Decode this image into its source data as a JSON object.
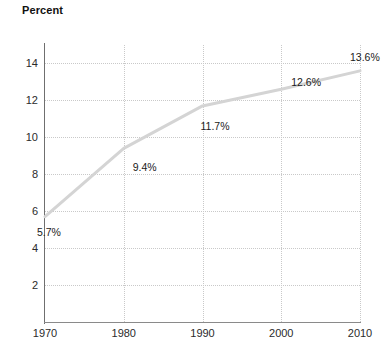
{
  "chart_data": {
    "type": "line",
    "title": "Percent",
    "xlabel": "",
    "ylabel": "Percent",
    "x": [
      1970,
      1980,
      1990,
      2000,
      2010
    ],
    "values": [
      5.7,
      9.4,
      11.7,
      12.6,
      13.6
    ],
    "point_labels": [
      "5.7%",
      "9.4%",
      "11.7%",
      "12.6%",
      "13.6%"
    ],
    "xticks": [
      "1970",
      "1980",
      "1990",
      "2000",
      "2010"
    ],
    "yticks": [
      "2",
      "4",
      "6",
      "8",
      "10",
      "12",
      "14"
    ],
    "ytick_values": [
      2,
      4,
      6,
      8,
      10,
      12,
      14
    ],
    "xlim": [
      1970,
      2010
    ],
    "ylim": [
      0,
      15
    ],
    "grid": true,
    "legend": "none",
    "series_color": "#d4d4d4",
    "grid_color": "#c9c9c9",
    "axis_color": "#6f6f6f",
    "text_color": "#1a1a1a",
    "background": "#ffffff"
  }
}
